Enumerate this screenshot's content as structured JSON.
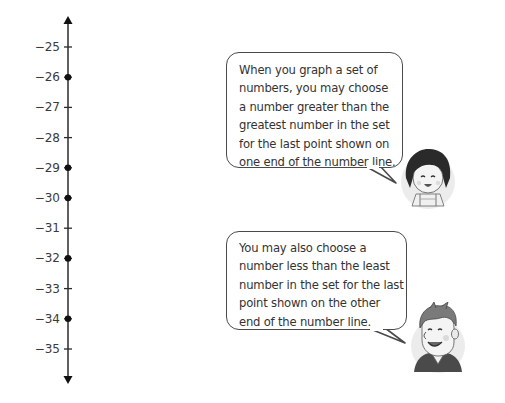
{
  "chart_data": {
    "type": "number_line",
    "orientation": "vertical",
    "range": [
      -35,
      -25
    ],
    "tick_labels": [
      "−25",
      "−26",
      "−27",
      "−28",
      "−29",
      "−30",
      "−31",
      "−32",
      "−33",
      "−34",
      "−35"
    ],
    "tick_values": [
      -25,
      -26,
      -27,
      -28,
      -29,
      -30,
      -31,
      -32,
      -33,
      -34,
      -35
    ],
    "plotted_points": [
      -26,
      -29,
      -30,
      -32,
      -34
    ],
    "arrows": "both ends",
    "title": "",
    "xlabel": "",
    "ylabel": ""
  },
  "speech_bubbles": [
    {
      "speaker": "girl",
      "lines": [
        "When you graph a set of",
        "numbers, you may choose",
        "a number greater than the",
        "greatest number in the set",
        "for the last point shown on",
        "one end of the number line."
      ]
    },
    {
      "speaker": "boy",
      "lines": [
        "You may also choose a",
        "number less than the least",
        "number in the set for the last",
        "point shown on the other",
        "end of the number line."
      ]
    }
  ],
  "colors": {
    "axis": "#2b2b2b",
    "text": "#333333",
    "bubble_border": "#4a4a4a"
  }
}
